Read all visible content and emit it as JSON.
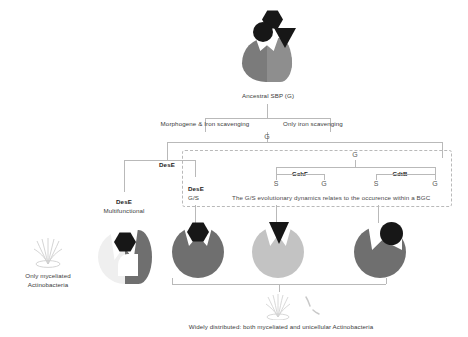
{
  "diagram": {
    "title_top": "Ancestral SBP (G)",
    "branch_labels": {
      "left": "Morphogene & Iron scavenging",
      "right": "Only iron scavenging"
    },
    "tree": {
      "root_g": "G",
      "sub_g": "G",
      "left_leaf": "DesE",
      "children": [
        {
          "name": "CchF",
          "states": [
            "S",
            "G"
          ]
        },
        {
          "name": "CdtB",
          "states": [
            "S",
            "G"
          ]
        }
      ]
    },
    "dashed_note": "The G/S evolutionary dynamics relates to the occurence within a BGC",
    "dese_inside": {
      "name": "DesE",
      "state": "G/S"
    },
    "dese_left": {
      "name": "DesE",
      "subtitle": "Multifunctional"
    },
    "footnote_left": {
      "line1": "Only myceliated",
      "line2": "Actinobacteria"
    },
    "footnote_bottom": "Widely distributed: both myceliated and unicellular Actinobacteria",
    "colors": {
      "dark_gray": "#7b7b7b",
      "mid_gray": "#8e8e8e",
      "light_gray": "#bfbfbf",
      "pale_gray": "#d6d6d6",
      "black_ligand": "#171717",
      "line": "#b9b9b9"
    },
    "icons": {
      "hexagon": "hexagon-ligand-icon",
      "circle": "circle-ligand-icon",
      "triangle": "triangle-ligand-icon",
      "mycelium": "mycelium-icon",
      "bacteria": "bacteria-rod-icon"
    }
  }
}
